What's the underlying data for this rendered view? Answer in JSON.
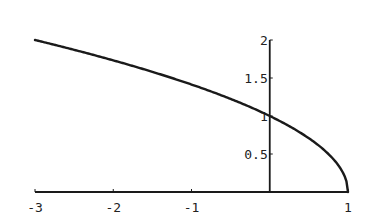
{
  "chart_data": {
    "type": "line",
    "title": "",
    "xlabel": "",
    "ylabel": "",
    "function": "y = sqrt(1 - x)",
    "xlim": [
      -3,
      1
    ],
    "ylim": [
      0,
      2
    ],
    "x_ticks": [
      -3,
      -2,
      -1,
      1
    ],
    "x_tick_labels": [
      "-3",
      "-2",
      "-1",
      "1"
    ],
    "y_ticks": [
      0.5,
      1,
      1.5,
      2
    ],
    "y_tick_labels": [
      "0.5",
      "1",
      "1.5",
      "2"
    ],
    "grid": false,
    "legend": null,
    "series": [
      {
        "name": "sqrt(1-x)",
        "x": [
          -3,
          -2.5,
          -2,
          -1.5,
          -1,
          -0.5,
          0,
          0.25,
          0.5,
          0.75,
          0.9,
          0.97,
          1
        ],
        "y": [
          2,
          1.871,
          1.732,
          1.581,
          1.414,
          1.225,
          1,
          0.866,
          0.707,
          0.5,
          0.316,
          0.173,
          0
        ]
      }
    ]
  },
  "colors": {
    "line": "#1a1a1a",
    "axis": "#1a1a1a",
    "background": "#ffffff"
  }
}
